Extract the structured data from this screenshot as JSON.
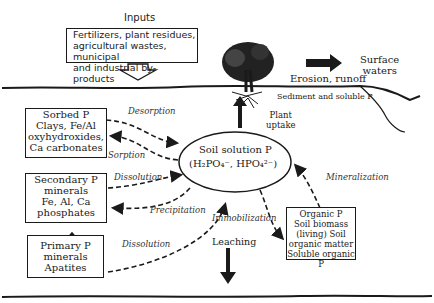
{
  "inputs": {
    "heading": "Inputs",
    "lines": [
      "Fertilizers, plant residues,",
      "agricultural wastes, municipal",
      "and industrial by-products"
    ]
  },
  "surface": {
    "surface_waters": [
      "Surface",
      "waters"
    ],
    "erosion": "Erosion, runoff",
    "sediment": "Sediment and soluble P",
    "plant_uptake": [
      "Plant",
      "uptake"
    ]
  },
  "center": {
    "title": "Soil solution P",
    "formula": "(H₂PO₄⁻, HPO₄²⁻)"
  },
  "pools": {
    "sorbed": [
      "Sorbed P",
      "Clays, Fe/Al",
      "oxyhydroxides,",
      "Ca carbonates"
    ],
    "secondary": [
      "Secondary P",
      "minerals",
      "Fe, Al, Ca",
      "phosphates"
    ],
    "primary": [
      "Primary P",
      "minerals",
      "Apatites"
    ],
    "organic": [
      "Organic P",
      "Soil biomass",
      "(living) Soil",
      "organic matter",
      "Soluble organic P"
    ]
  },
  "processes": {
    "desorption": "Desorption",
    "sorption": "Sorption",
    "dissolution1": "Dissolution",
    "precipitation": "Precipitation",
    "dissolution2": "Dissolution",
    "immobilization": "Immobilization",
    "mineralization": "Mineralization",
    "leaching": "Leaching"
  },
  "colors": {
    "ink": "#1a1a1a",
    "background": "#ffffff"
  }
}
